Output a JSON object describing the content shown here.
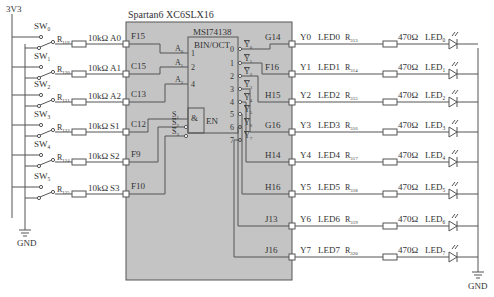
{
  "power": {
    "supply": "3V3",
    "ground_left": "GND",
    "ground_right": "GND"
  },
  "fpga": {
    "title": "Spartan6 XC6SLX16",
    "fill": "#c8c8c8"
  },
  "decoder": {
    "title": "MSI74138",
    "function": "BIN/OCT",
    "and_symbol": "&",
    "enable": "EN",
    "addr_inputs": [
      {
        "label": "A",
        "sub": "0",
        "pin": "1"
      },
      {
        "label": "A",
        "sub": "1",
        "pin": "2"
      },
      {
        "label": "A",
        "sub": "2",
        "pin": "4"
      }
    ],
    "enable_inputs": [
      {
        "label": "S",
        "sub": "1"
      },
      {
        "label": "S",
        "sub": "2",
        "overline": true
      },
      {
        "label": "S",
        "sub": "3",
        "overline": true
      }
    ],
    "outputs": [
      {
        "num": "0",
        "label": "Y",
        "sub": "0"
      },
      {
        "num": "1",
        "label": "Y",
        "sub": "1"
      },
      {
        "num": "2",
        "label": "Y",
        "sub": "2"
      },
      {
        "num": "3",
        "label": "Y",
        "sub": "3"
      },
      {
        "num": "4",
        "label": "Y",
        "sub": "4"
      },
      {
        "num": "5",
        "label": "Y",
        "sub": "5"
      },
      {
        "num": "6",
        "label": "Y",
        "sub": "6"
      },
      {
        "num": "7",
        "label": "Y",
        "sub": "7"
      }
    ]
  },
  "switches": [
    {
      "name": "SW",
      "sub": "0",
      "resistor": "R",
      "rsub": "119",
      "value": "10kΩ",
      "signal": "A0",
      "pin": "F15"
    },
    {
      "name": "SW",
      "sub": "1",
      "resistor": "R",
      "rsub": "120",
      "value": "10kΩ",
      "signal": "A1",
      "pin": "C15"
    },
    {
      "name": "SW",
      "sub": "2",
      "resistor": "R",
      "rsub": "121",
      "value": "10kΩ",
      "signal": "A2",
      "pin": "C13"
    },
    {
      "name": "SW",
      "sub": "3",
      "resistor": "R",
      "rsub": "122",
      "value": "10kΩ",
      "signal": "S1",
      "pin": "C12"
    },
    {
      "name": "SW",
      "sub": "4",
      "resistor": "R",
      "rsub": "124",
      "value": "10kΩ",
      "signal": "S2",
      "pin": "F9"
    },
    {
      "name": "SW",
      "sub": "5",
      "resistor": "R",
      "rsub": "125",
      "value": "10kΩ",
      "signal": "S3",
      "pin": "F10"
    }
  ],
  "leds": [
    {
      "pin": "G14",
      "signal": "Y0",
      "net": "LED0",
      "resistor": "R",
      "rsub": "313",
      "value": "470Ω",
      "led": "LED",
      "lsub": "0"
    },
    {
      "pin": "F16",
      "signal": "Y1",
      "net": "LED1",
      "resistor": "R",
      "rsub": "314",
      "value": "470Ω",
      "led": "LED",
      "lsub": "1"
    },
    {
      "pin": "H15",
      "signal": "Y2",
      "net": "LED2",
      "resistor": "R",
      "rsub": "315",
      "value": "470Ω",
      "led": "LED",
      "lsub": "2"
    },
    {
      "pin": "G16",
      "signal": "Y3",
      "net": "LED3",
      "resistor": "R",
      "rsub": "316",
      "value": "470Ω",
      "led": "LED",
      "lsub": "3"
    },
    {
      "pin": "H14",
      "signal": "Y4",
      "net": "LED4",
      "resistor": "R",
      "rsub": "317",
      "value": "470Ω",
      "led": "LED",
      "lsub": "4"
    },
    {
      "pin": "H16",
      "signal": "Y5",
      "net": "LED5",
      "resistor": "R",
      "rsub": "318",
      "value": "470Ω",
      "led": "LED",
      "lsub": "5"
    },
    {
      "pin": "J13",
      "signal": "Y6",
      "net": "LED6",
      "resistor": "R",
      "rsub": "319",
      "value": "470Ω",
      "led": "LED",
      "lsub": "6"
    },
    {
      "pin": "J16",
      "signal": "Y7",
      "net": "LED7",
      "resistor": "R",
      "rsub": "320",
      "value": "470Ω",
      "led": "LED",
      "lsub": "7"
    }
  ]
}
